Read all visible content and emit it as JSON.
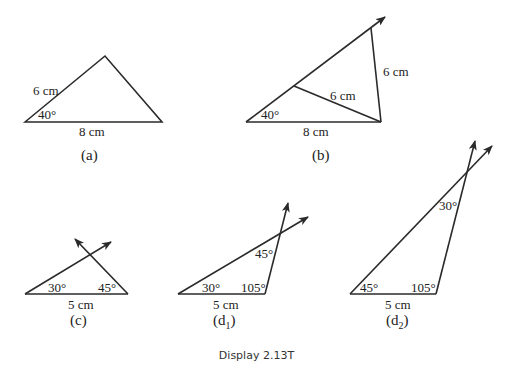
{
  "caption": "Display 2.13T",
  "figures": {
    "a": {
      "label": "(a)",
      "side_left": "6 cm",
      "angle": "40°",
      "base": "8 cm"
    },
    "b": {
      "label": "(b)",
      "angle": "40°",
      "base": "8 cm",
      "inner_side": "6 cm",
      "outer_side": "6 cm"
    },
    "c": {
      "label": "(c)",
      "angle_left": "30°",
      "angle_right": "45°",
      "base": "5 cm"
    },
    "d1": {
      "label_main": "(d",
      "label_sub": "1",
      "label_close": ")",
      "angle_left": "30°",
      "angle_right": "105°",
      "angle_top": "45°",
      "base": "5 cm"
    },
    "d2": {
      "label_main": "(d",
      "label_sub": "2",
      "label_close": ")",
      "angle_left": "45°",
      "angle_right": "105°",
      "angle_top": "30°",
      "base": "5 cm"
    }
  }
}
